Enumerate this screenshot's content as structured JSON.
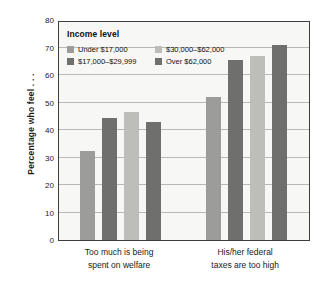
{
  "chart_data": {
    "type": "bar",
    "title": "",
    "subtitle": "",
    "xlabel": "",
    "ylabel": "Percentage who feel . . .",
    "ylim": [
      0,
      80
    ],
    "yticks": [
      0,
      10,
      20,
      30,
      40,
      50,
      60,
      70,
      80
    ],
    "ytick_labels": [
      "0",
      "10",
      "20",
      "30",
      "40",
      "50",
      "60",
      "70",
      "80"
    ],
    "grid": true,
    "legend_position": "top-left",
    "legend_title": "Income level",
    "categories": [
      "Too much is being spent on welfare",
      "His/her federal taxes are too high"
    ],
    "category_lines": [
      [
        "Too much is being",
        "spent on welfare"
      ],
      [
        "His/her federal",
        "taxes are too high"
      ]
    ],
    "series": [
      {
        "name": "Under $17,000",
        "color": "#9c9c9a",
        "values": [
          32.5,
          52
        ]
      },
      {
        "name": "$17,000–$29,999",
        "color": "#6f6f6d",
        "values": [
          44.5,
          65.5
        ]
      },
      {
        "name": "$30,000–$62,000",
        "color": "#bdbdba",
        "values": [
          46.5,
          67
        ]
      },
      {
        "name": "Over $62,000",
        "color": "#6f6f6d",
        "values": [
          43,
          71
        ]
      }
    ]
  },
  "colors": {
    "plot_background": "#f7f7f5",
    "plot_border": "#3d3d3d",
    "gridline": "#b9b9b4",
    "text": "#1a1a1a",
    "page_background": "#ffffff"
  }
}
